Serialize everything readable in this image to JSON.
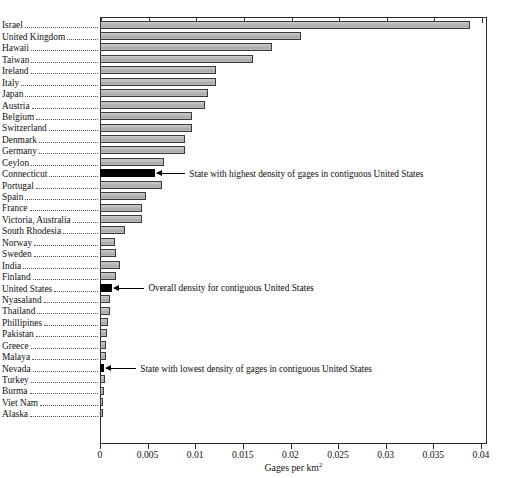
{
  "chart_data": {
    "type": "bar",
    "orientation": "horizontal",
    "title": "",
    "xlabel": "Gages per km2",
    "xlabel_base": "Gages per km",
    "xlabel_exponent": "2",
    "ylabel": "",
    "xlim": [
      0,
      0.04
    ],
    "xticks": [
      0,
      0.005,
      0.01,
      0.015,
      0.02,
      0.025,
      0.03,
      0.035,
      0.04
    ],
    "xticklabels": [
      "0",
      "0.005",
      "0.01",
      "0.015",
      "0.02",
      "0.025",
      "0.03",
      "0.035",
      "0.04"
    ],
    "grid": false,
    "legend": "none",
    "bar_color": "#b4b4b4",
    "highlight_color": "#000000",
    "categories": [
      "Israel",
      "United Kingdom",
      "Hawaii",
      "Taiwan",
      "Ireland",
      "Italy",
      "Japan",
      "Austria",
      "Belgium",
      "Switzerland",
      "Denmark",
      "Germany",
      "Ceylon",
      "Connecticut",
      "Portugal",
      "Spain",
      "France",
      "Victoria, Australia",
      "South Rhodesia",
      "Norway",
      "Sweden",
      "India",
      "Finland",
      "United States",
      "Nyasaland",
      "Thailand",
      "Phillipines",
      "Pakistan",
      "Greece",
      "Malaya",
      "Nevada",
      "Turkey",
      "Burma",
      "Viet Nam",
      "Alaska"
    ],
    "values": [
      0.0388,
      0.0211,
      0.0181,
      0.0161,
      0.0122,
      0.0122,
      0.0113,
      0.011,
      0.0097,
      0.0097,
      0.0089,
      0.0089,
      0.0067,
      0.0058,
      0.0065,
      0.0048,
      0.0044,
      0.0044,
      0.0026,
      0.0016,
      0.0017,
      0.0021,
      0.0017,
      0.0013,
      0.0011,
      0.001,
      0.00085,
      0.00075,
      0.00065,
      0.0006,
      0.00045,
      0.00052,
      0.00042,
      0.00032,
      0.00012
    ],
    "highlighted": [
      "Connecticut",
      "United States",
      "Nevada"
    ],
    "annotations": [
      {
        "category": "Connecticut",
        "text": "State with highest density of gages in contiguous United States"
      },
      {
        "category": "United States",
        "text": "Overall density for contiguous United States"
      },
      {
        "category": "Nevada",
        "text": "State with lowest density of gages in contiguous United States"
      }
    ]
  }
}
